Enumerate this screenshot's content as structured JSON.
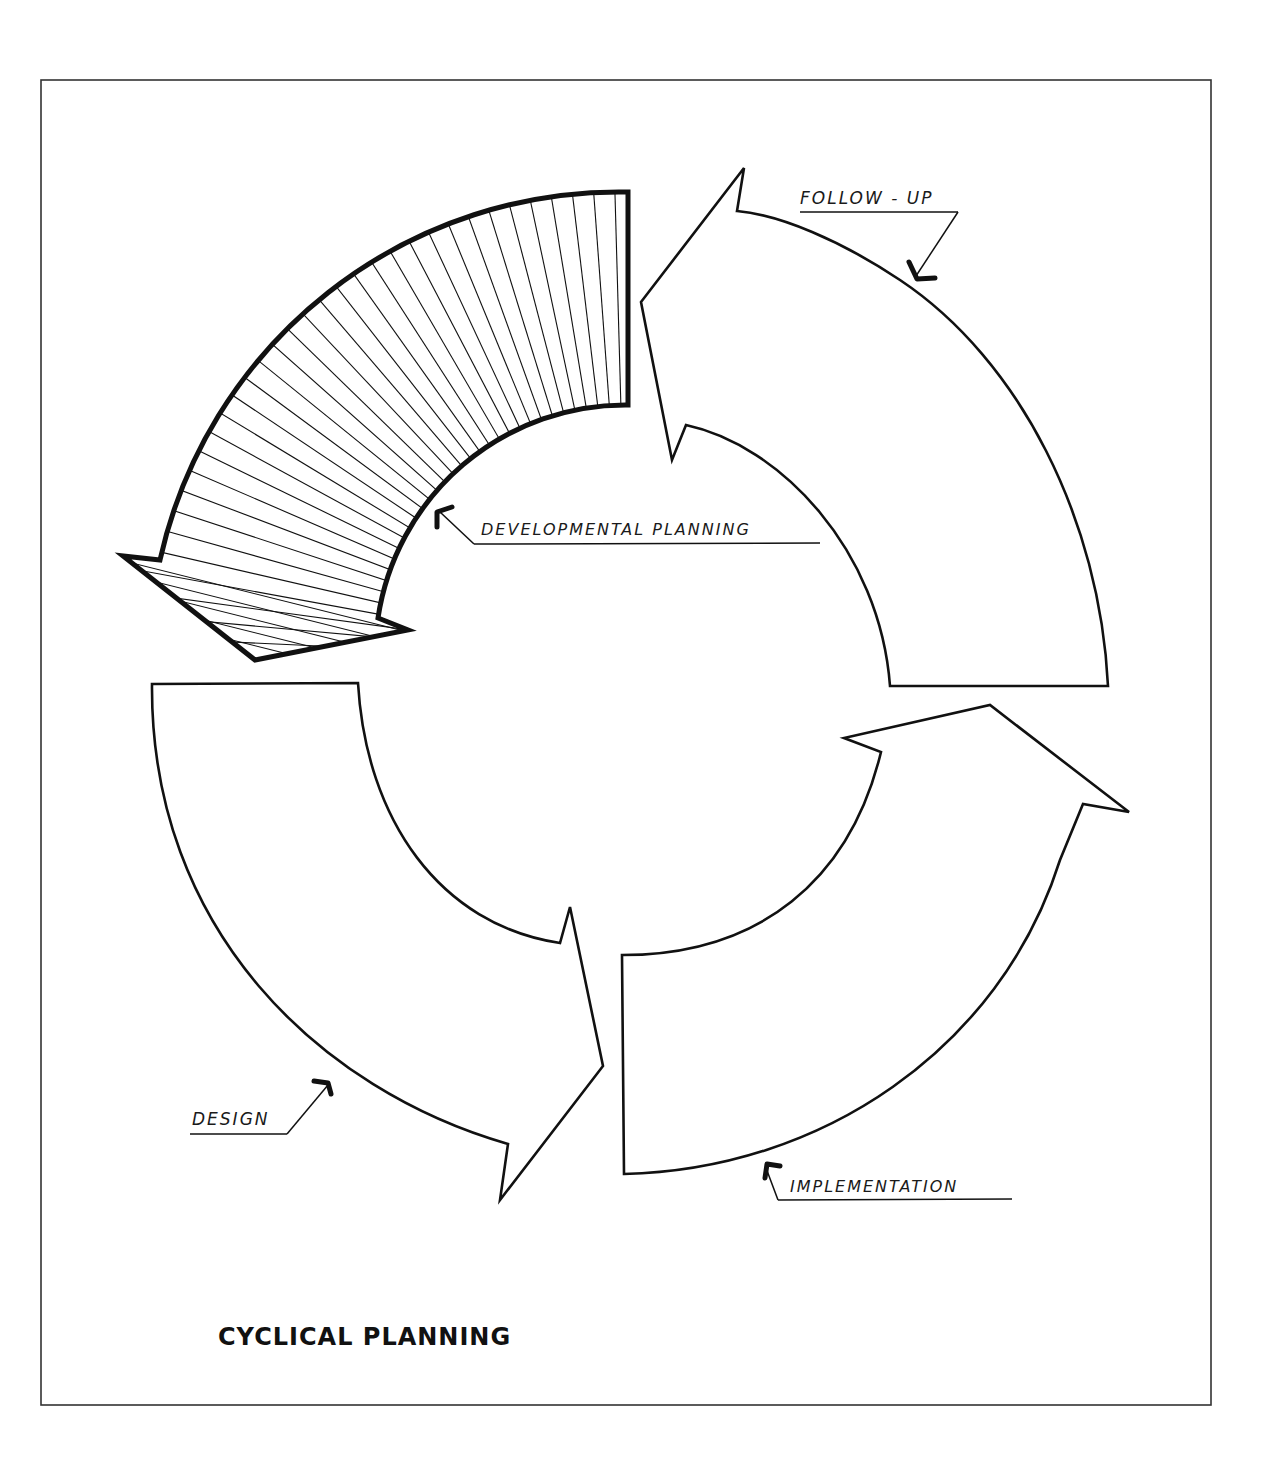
{
  "diagram": {
    "title": "CYCLICAL PLANNING",
    "type": "cycle",
    "stages": [
      {
        "id": "developmental-planning",
        "label": "DEVELOPMENTAL PLANNING",
        "highlighted": true,
        "fill": "hatched"
      },
      {
        "id": "design",
        "label": "DESIGN",
        "highlighted": false,
        "fill": "none"
      },
      {
        "id": "implementation",
        "label": "IMPLEMENTATION",
        "highlighted": false,
        "fill": "none"
      },
      {
        "id": "follow-up",
        "label": "FOLLOW - UP",
        "highlighted": false,
        "fill": "none"
      }
    ],
    "flow_direction": "counter-clockwise",
    "colors": {
      "ink": "#111111",
      "paper": "#ffffff",
      "frame": "#333333"
    }
  }
}
